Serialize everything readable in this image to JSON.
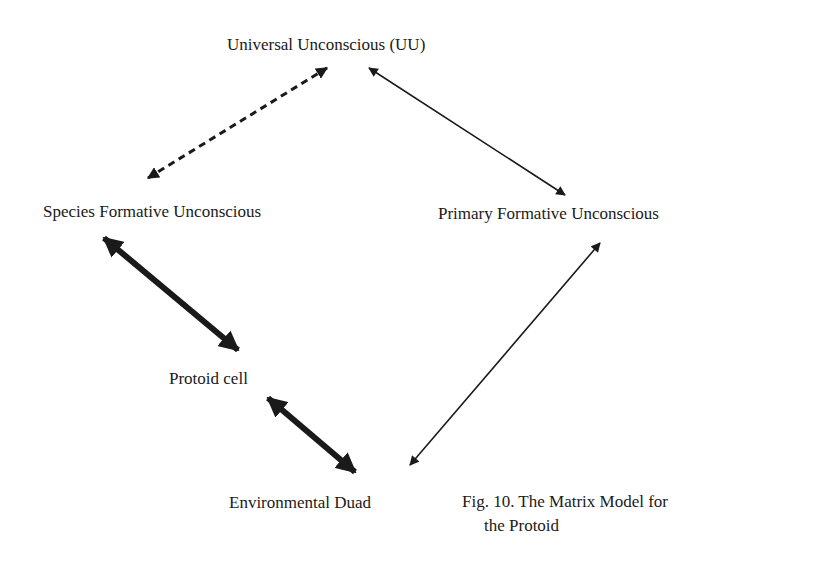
{
  "nodes": {
    "uu": "Universal Unconscious (UU)",
    "sfu": "Species Formative Unconscious",
    "pfu": "Primary Formative Unconscious",
    "protoid": "Protoid cell",
    "env": "Environmental Duad"
  },
  "caption": {
    "line1": "Fig. 10. The Matrix Model for",
    "line2": "the Protoid"
  },
  "edges": [
    {
      "from": "uu",
      "to": "sfu",
      "style": "dashed",
      "bidirectional": true
    },
    {
      "from": "uu",
      "to": "pfu",
      "style": "thin",
      "bidirectional": true
    },
    {
      "from": "sfu",
      "to": "protoid",
      "style": "thick",
      "bidirectional": true
    },
    {
      "from": "protoid",
      "to": "env",
      "style": "thick",
      "bidirectional": true
    },
    {
      "from": "pfu",
      "to": "env",
      "style": "thin",
      "bidirectional": true
    }
  ],
  "colors": {
    "ink": "#1a1a1a",
    "background": "#ffffff"
  }
}
